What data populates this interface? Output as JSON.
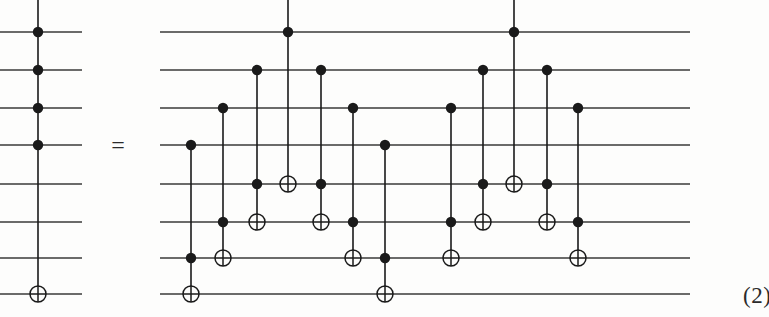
{
  "figure": {
    "kind": "quantum-circuit-identity",
    "equation_number": "(2)",
    "equals_sign": "=",
    "width": 769,
    "height": 317,
    "background_color": "#fdfdfc",
    "ink_color": "#1a1a1a",
    "wire_color": "#3a3a3a",
    "num_wires": 8,
    "wire_y": [
      32,
      70,
      108,
      145,
      184,
      222,
      258,
      294
    ],
    "wire_stroke_width": 1.6,
    "control_dot_radius": 5.2,
    "target_circle_radius": 8.0,
    "target_stroke_width": 1.5
  },
  "equals": {
    "label": "=",
    "x": 118,
    "y": 145
  },
  "left_circuit": {
    "name": "multi-controlled-not",
    "wire_x_start": 0,
    "wire_x_end": 82,
    "column_x": 38,
    "vertical_top": 0,
    "gates": [
      {
        "type": "control",
        "wire": 0
      },
      {
        "type": "control",
        "wire": 1
      },
      {
        "type": "control",
        "wire": 2
      },
      {
        "type": "control",
        "wire": 3
      },
      {
        "type": "target",
        "wire": 7
      }
    ]
  },
  "right_circuit": {
    "name": "toffoli-decomposition",
    "wire_x_start": 160,
    "wire_x_end": 690,
    "columns": [
      {
        "id": "c1",
        "x": 191,
        "vertical_top": null,
        "gates": [
          {
            "type": "control",
            "wire": 3
          },
          {
            "type": "control",
            "wire": 6
          },
          {
            "type": "target",
            "wire": 7
          }
        ]
      },
      {
        "id": "c2",
        "x": 223,
        "vertical_top": null,
        "gates": [
          {
            "type": "control",
            "wire": 2
          },
          {
            "type": "control",
            "wire": 5
          },
          {
            "type": "target",
            "wire": 6
          }
        ]
      },
      {
        "id": "c3",
        "x": 257,
        "vertical_top": null,
        "gates": [
          {
            "type": "control",
            "wire": 1
          },
          {
            "type": "control",
            "wire": 4
          },
          {
            "type": "target",
            "wire": 5
          }
        ]
      },
      {
        "id": "c4",
        "x": 288,
        "vertical_top": 0,
        "gates": [
          {
            "type": "control",
            "wire": 0
          },
          {
            "type": "target",
            "wire": 4
          }
        ]
      },
      {
        "id": "c5",
        "x": 321,
        "vertical_top": null,
        "gates": [
          {
            "type": "control",
            "wire": 1
          },
          {
            "type": "control",
            "wire": 4
          },
          {
            "type": "target",
            "wire": 5
          }
        ]
      },
      {
        "id": "c6",
        "x": 353,
        "vertical_top": null,
        "gates": [
          {
            "type": "control",
            "wire": 2
          },
          {
            "type": "control",
            "wire": 5
          },
          {
            "type": "target",
            "wire": 6
          }
        ]
      },
      {
        "id": "c7",
        "x": 385,
        "vertical_top": null,
        "gates": [
          {
            "type": "control",
            "wire": 3
          },
          {
            "type": "control",
            "wire": 6
          },
          {
            "type": "target",
            "wire": 7
          }
        ]
      },
      {
        "id": "c8",
        "x": 451,
        "vertical_top": null,
        "gates": [
          {
            "type": "control",
            "wire": 2
          },
          {
            "type": "control",
            "wire": 5
          },
          {
            "type": "target",
            "wire": 6
          }
        ]
      },
      {
        "id": "c9",
        "x": 483,
        "vertical_top": null,
        "gates": [
          {
            "type": "control",
            "wire": 1
          },
          {
            "type": "control",
            "wire": 4
          },
          {
            "type": "target",
            "wire": 5
          }
        ]
      },
      {
        "id": "c10",
        "x": 514,
        "vertical_top": 0,
        "gates": [
          {
            "type": "control",
            "wire": 0
          },
          {
            "type": "target",
            "wire": 4
          }
        ]
      },
      {
        "id": "c11",
        "x": 547,
        "vertical_top": null,
        "gates": [
          {
            "type": "control",
            "wire": 1
          },
          {
            "type": "control",
            "wire": 4
          },
          {
            "type": "target",
            "wire": 5
          }
        ]
      },
      {
        "id": "c12",
        "x": 578,
        "vertical_top": null,
        "gates": [
          {
            "type": "control",
            "wire": 2
          },
          {
            "type": "control",
            "wire": 5
          },
          {
            "type": "target",
            "wire": 6
          }
        ]
      }
    ]
  }
}
